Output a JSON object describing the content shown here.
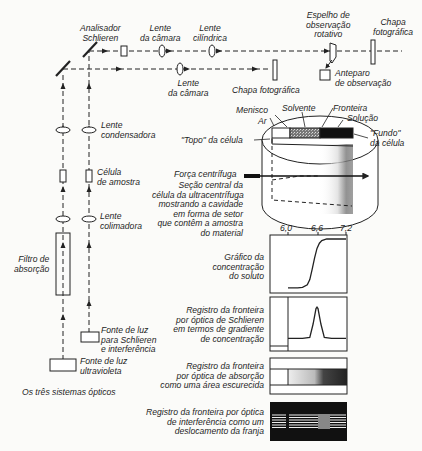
{
  "title": "Os três sistemas ópticos",
  "optics": {
    "analisador": [
      "Analisador",
      "Schlieren"
    ],
    "lente_camara_top": [
      "Lente",
      "da câmara"
    ],
    "lente_cilindrica": [
      "Lente",
      "cilíndrica"
    ],
    "espelho": [
      "Espelho de",
      "observação",
      "rotativo"
    ],
    "chapa_top": [
      "Chapa",
      "fotográfica"
    ],
    "lente_camara_bottom": [
      "Lente",
      "da câmara"
    ],
    "chapa_bottom": "Chapa fotográfica",
    "anteparo": [
      "Anteparo",
      "de observação"
    ],
    "lente_condensadora": [
      "Lente",
      "condensadora"
    ],
    "celula_amostra": [
      "Célula",
      "de amostra"
    ],
    "lente_colimadora": [
      "Lente",
      "colimadora"
    ],
    "filtro": [
      "Filtro de",
      "absorção"
    ],
    "fonte_schlieren": [
      "Fonte de luz",
      "para Schlieren",
      "e interferência"
    ],
    "fonte_uv": [
      "Fonte de luz",
      "ultravioleta"
    ]
  },
  "cell": {
    "menisco": "Menisco",
    "solvente": "Solvente",
    "fronteira": "Fronteira",
    "ar": "Ar",
    "solucao": "Solução",
    "topo": "\"Topo\" da célula",
    "fundo": [
      "\"Fundo\"",
      "da célula"
    ],
    "forca": "Força centrífuga",
    "secao": [
      "Seção central da",
      "célula da ultracentrífuga",
      "mostrando a cavidade",
      "em forma de setor",
      "que contêm a amostra",
      "do material"
    ]
  },
  "graphs": {
    "ticks": [
      "6,0",
      "6,6",
      "7,2"
    ],
    "concentracao": [
      "Gráfico da",
      "concentração",
      "do soluto"
    ],
    "schlieren": [
      "Registro da fronteira",
      "por óptica de Schlieren",
      "em termos de gradiente",
      "de concentração"
    ],
    "absorcao": [
      "Registro da fronteira",
      "por óptica de absorção",
      "como uma área escurecida"
    ],
    "interferencia": [
      "Registro da fronteira por óptica",
      "de interferência como um",
      "deslocamento da franja"
    ]
  },
  "chart_data": [
    {
      "type": "line",
      "title": "Gráfico da concentração do soluto",
      "x_ticks": [
        6.0,
        6.6,
        7.2
      ],
      "xlim": [
        6.0,
        7.2
      ],
      "ylim": [
        0,
        1
      ],
      "x": [
        6.0,
        6.2,
        6.3,
        6.4,
        6.45,
        6.5,
        6.55,
        6.6,
        6.65,
        6.7,
        6.8,
        6.9,
        7.2
      ],
      "values": [
        0.04,
        0.04,
        0.05,
        0.1,
        0.2,
        0.4,
        0.62,
        0.8,
        0.9,
        0.95,
        0.98,
        0.98,
        0.98
      ]
    },
    {
      "type": "line",
      "title": "Registro da fronteira por óptica de Schlieren em termos de gradiente de concentração",
      "xlim": [
        6.0,
        7.2
      ],
      "ylim": [
        0,
        1
      ],
      "x": [
        6.0,
        6.3,
        6.45,
        6.52,
        6.58,
        6.6,
        6.62,
        6.68,
        6.75,
        6.9,
        7.2
      ],
      "values": [
        0.2,
        0.2,
        0.22,
        0.5,
        0.82,
        0.85,
        0.82,
        0.5,
        0.22,
        0.2,
        0.2
      ]
    }
  ]
}
